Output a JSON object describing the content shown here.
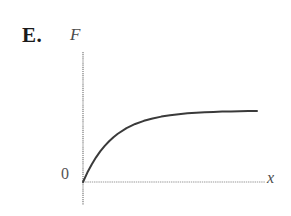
{
  "figure": {
    "choice_letter": "E.",
    "origin_label": "0",
    "y_axis_label": "F",
    "x_axis_label": "x",
    "background_color": "#ffffff",
    "axis_color": "#9a9a9a",
    "curve_color": "#3a3a3a",
    "text_color": "#1a1a1a"
  },
  "chart_data": {
    "type": "line",
    "title": "",
    "subtitle": "",
    "xlabel": "x",
    "ylabel": "F",
    "annotations": [
      "E.",
      "0"
    ],
    "legend": [],
    "legend_position": "none",
    "grid": false,
    "axis_style": "two-axis-origin-arrowless",
    "xlim": [
      0,
      10
    ],
    "ylim": [
      0,
      1.15
    ],
    "xticks": [],
    "yticks": [],
    "series": [
      {
        "name": "F(x)",
        "color": "#3a3a3a",
        "x": [
          0.0,
          0.25,
          0.5,
          0.75,
          1.0,
          1.25,
          1.5,
          1.75,
          2.0,
          2.5,
          3.0,
          3.5,
          4.0,
          4.5,
          5.0,
          5.5,
          6.0,
          6.5,
          7.0,
          7.5,
          8.0,
          8.5,
          9.0,
          9.5,
          10.0
        ],
        "values": [
          0.0,
          0.132,
          0.246,
          0.346,
          0.432,
          0.507,
          0.572,
          0.628,
          0.677,
          0.756,
          0.814,
          0.858,
          0.891,
          0.917,
          0.936,
          0.951,
          0.963,
          0.971,
          0.978,
          0.983,
          0.987,
          0.99,
          0.993,
          0.994,
          0.996
        ]
      }
    ]
  }
}
